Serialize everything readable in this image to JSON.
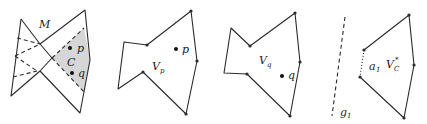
{
  "panels": [
    {
      "id": "panel-1",
      "labels": {
        "manifold": "M",
        "region": "C",
        "p": "p",
        "q": "q"
      }
    },
    {
      "id": "panel-2",
      "labels": {
        "region": "V",
        "region_sub": "p",
        "p": "p"
      }
    },
    {
      "id": "panel-3",
      "labels": {
        "region": "V",
        "region_sub": "q",
        "q": "q"
      }
    },
    {
      "id": "panel-4",
      "labels": {
        "line": "g",
        "line_sub": "1",
        "edge": "a",
        "edge_sub": "1",
        "region": "V",
        "region_sub": "C",
        "region_sup": "*"
      }
    }
  ],
  "colors": {
    "stroke": "#2a2a2a",
    "shade": "#d6d6d6",
    "background": "#ffffff"
  }
}
